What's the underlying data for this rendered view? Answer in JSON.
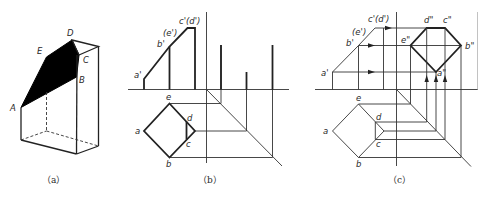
{
  "figure": {
    "panels": [
      {
        "id": "a",
        "caption": "（a）",
        "description": "Isometric view of prism with sectioned face ABCDE shaded",
        "points": {
          "A": "A",
          "B": "B",
          "C": "C",
          "D": "D",
          "E": "E"
        }
      },
      {
        "id": "b",
        "caption": "（b）",
        "front_view_labels": {
          "a": "a'",
          "b": "b'",
          "e": "(e')",
          "cd": "c'(d')"
        },
        "top_view_labels": {
          "a": "a",
          "b": "b",
          "c": "c",
          "d": "d",
          "e": "e"
        }
      },
      {
        "id": "c",
        "caption": "（c）",
        "front_view_labels": {
          "a": "a'",
          "b": "b'",
          "e": "(e')",
          "cd": "c'(d')"
        },
        "top_view_labels": {
          "a": "a",
          "b": "b",
          "c": "c",
          "d": "d",
          "e": "e"
        },
        "side_view_labels": {
          "a": "a\"",
          "b": "b\"",
          "c": "c\"",
          "d": "d\"",
          "e": "e\""
        }
      }
    ],
    "colors": {
      "line": "#222222",
      "fill": "#000000",
      "background": "#ffffff"
    }
  }
}
